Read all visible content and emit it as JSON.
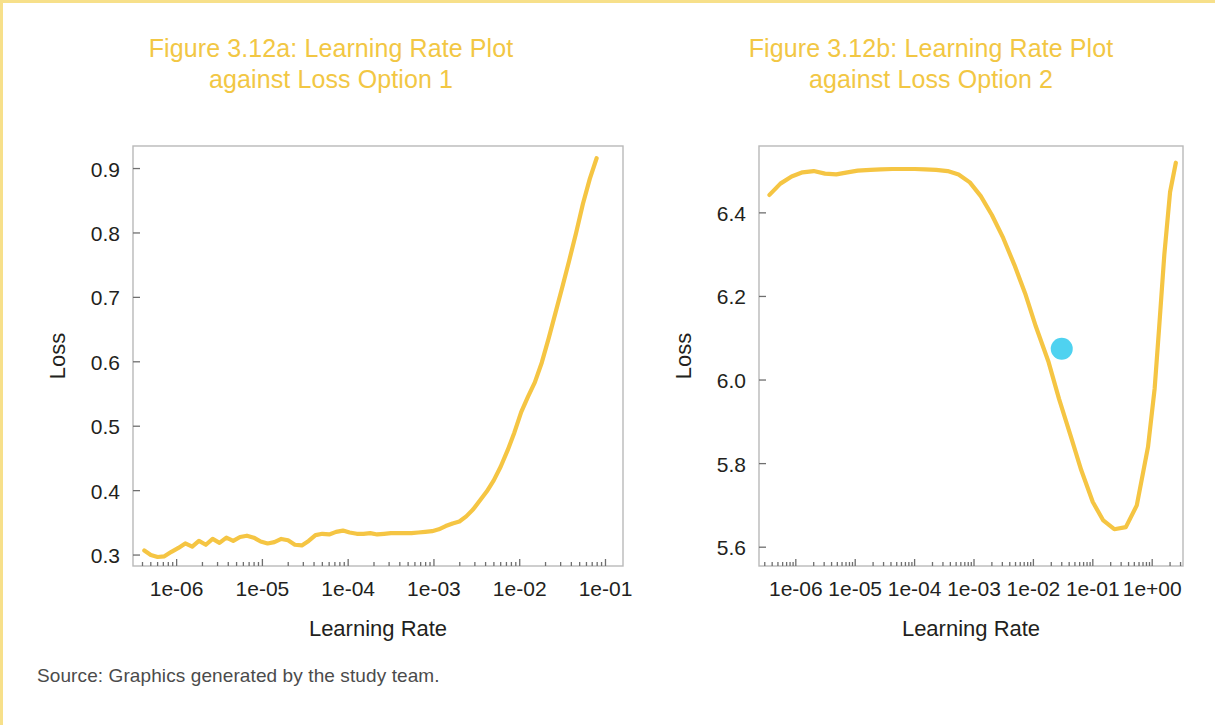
{
  "figure": {
    "source_note": "Source: Graphics generated by the study team.",
    "frame_color": "#f7e08a",
    "title_color": "#f2c744",
    "line_color": "#f5c543",
    "marker_color": "#4fd2f0"
  },
  "panel_a": {
    "title_line1": "Figure 3.12a:  Learning Rate Plot",
    "title_line2": "against Loss Option 1",
    "xlabel": "Learning Rate",
    "ylabel": "Loss"
  },
  "panel_b": {
    "title_line1": "Figure 3.12b:  Learning Rate Plot",
    "title_line2": "against Loss Option 2",
    "xlabel": "Learning Rate",
    "ylabel": "Loss"
  },
  "chart_data": [
    {
      "id": "figure-3-12a",
      "type": "line",
      "title": "Figure 3.12a:  Learning Rate Plot against Loss Option 1",
      "xlabel": "Learning Rate",
      "ylabel": "Loss",
      "xscale": "log",
      "xlim": [
        3.1e-07,
        0.16
      ],
      "ylim": [
        0.283,
        0.935
      ],
      "xticks": [
        1e-06,
        1e-05,
        0.0001,
        0.001,
        0.01,
        0.1
      ],
      "xticklabels": [
        "1e-06",
        "1e-05",
        "1e-04",
        "1e-03",
        "1e-02",
        "1e-01"
      ],
      "yticks": [
        0.3,
        0.4,
        0.5,
        0.6,
        0.7,
        0.8,
        0.9
      ],
      "yticklabels": [
        "0.3",
        "0.4",
        "0.5",
        "0.6",
        "0.7",
        "0.8",
        "0.9"
      ],
      "grid": false,
      "legend": null,
      "series": [
        {
          "name": "Loss",
          "x": [
            4.2e-07,
            5e-07,
            6e-07,
            7.2e-07,
            8.7e-07,
            1.05e-06,
            1.26e-06,
            1.52e-06,
            1.82e-06,
            2.19e-06,
            2.63e-06,
            3.16e-06,
            3.8e-06,
            4.57e-06,
            5.49e-06,
            6.6e-06,
            7.94e-06,
            9.54e-06,
            1.15e-05,
            1.38e-05,
            1.66e-05,
            1.99e-05,
            2.39e-05,
            2.88e-05,
            3.46e-05,
            4.16e-05,
            5e-05,
            6.01e-05,
            7.23e-05,
            8.69e-05,
            0.000104,
            0.000126,
            0.000151,
            0.000181,
            0.000218,
            0.000262,
            0.000315,
            0.000379,
            0.000455,
            0.000547,
            0.000658,
            0.000791,
            0.000951,
            0.00114,
            0.00137,
            0.00165,
            0.00198,
            0.00238,
            0.00287,
            0.00345,
            0.00414,
            0.00498,
            0.00599,
            0.0072,
            0.00865,
            0.0104,
            0.0125,
            0.015,
            0.0181,
            0.0217,
            0.0261,
            0.0314,
            0.0377,
            0.0454,
            0.0545,
            0.0656,
            0.0788
          ],
          "y": [
            0.307,
            0.3,
            0.297,
            0.298,
            0.305,
            0.311,
            0.318,
            0.313,
            0.322,
            0.316,
            0.325,
            0.319,
            0.327,
            0.322,
            0.328,
            0.33,
            0.327,
            0.321,
            0.318,
            0.32,
            0.325,
            0.323,
            0.316,
            0.315,
            0.322,
            0.331,
            0.333,
            0.332,
            0.336,
            0.338,
            0.335,
            0.333,
            0.333,
            0.334,
            0.332,
            0.333,
            0.334,
            0.334,
            0.334,
            0.334,
            0.335,
            0.336,
            0.337,
            0.34,
            0.345,
            0.349,
            0.352,
            0.36,
            0.371,
            0.385,
            0.399,
            0.416,
            0.437,
            0.462,
            0.49,
            0.522,
            0.546,
            0.568,
            0.599,
            0.636,
            0.676,
            0.716,
            0.757,
            0.8,
            0.845,
            0.884,
            0.916
          ]
        }
      ],
      "markers": []
    },
    {
      "id": "figure-3-12b",
      "type": "line",
      "title": "Figure 3.12b:  Learning Rate Plot against Loss Option 2",
      "xlabel": "Learning Rate",
      "ylabel": "Loss",
      "xscale": "log",
      "xlim": [
        2.4e-07,
        3.3
      ],
      "ylim": [
        5.555,
        6.56
      ],
      "xticks": [
        1e-06,
        1e-05,
        0.0001,
        0.001,
        0.01,
        0.1,
        1.0
      ],
      "xticklabels": [
        "1e-06",
        "1e-05",
        "1e-04",
        "1e-03",
        "1e-02",
        "1e-01",
        "1e+00"
      ],
      "yticks": [
        5.6,
        5.8,
        6.0,
        6.2,
        6.4
      ],
      "yticklabels": [
        "5.6",
        "5.8",
        "6.0",
        "6.2",
        "6.4"
      ],
      "grid": false,
      "legend": null,
      "series": [
        {
          "name": "Loss",
          "x": [
            3.6e-07,
            5.5e-07,
            8.5e-07,
            1.3e-06,
            2e-06,
            3.1e-06,
            4.8e-06,
            7.4e-06,
            1.1e-05,
            1.8e-05,
            2.7e-05,
            4.2e-05,
            6.4e-05,
            0.0001,
            0.00015,
            0.00023,
            0.00036,
            0.00055,
            0.00085,
            0.0013,
            0.002,
            0.0031,
            0.0048,
            0.0074,
            0.011,
            0.018,
            0.027,
            0.042,
            0.064,
            0.1,
            0.15,
            0.23,
            0.36,
            0.55,
            0.85,
            1.1,
            1.3,
            1.6,
            2.0,
            2.5
          ],
          "y": [
            6.443,
            6.47,
            6.487,
            6.497,
            6.5,
            6.494,
            6.492,
            6.497,
            6.501,
            6.503,
            6.504,
            6.505,
            6.505,
            6.505,
            6.504,
            6.503,
            6.5,
            6.492,
            6.473,
            6.44,
            6.395,
            6.34,
            6.275,
            6.204,
            6.128,
            6.043,
            5.955,
            5.868,
            5.784,
            5.708,
            5.664,
            5.643,
            5.648,
            5.7,
            5.84,
            5.98,
            6.12,
            6.3,
            6.45,
            6.52
          ]
        }
      ],
      "markers": [
        {
          "name": "suggested-learning-rate-marker",
          "x": 0.03,
          "y": 6.075,
          "color": "#4fd2f0",
          "radius": 11
        }
      ]
    }
  ]
}
